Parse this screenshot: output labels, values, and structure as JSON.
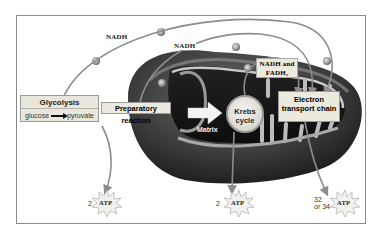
{
  "diagram": {
    "stages": {
      "glycolysis": {
        "title": "Glycolysis",
        "reactant": "glucose",
        "product": "pyruvate"
      },
      "preparatory_reaction": "Preparatory reaction",
      "krebs_cycle": "Krebs cycle",
      "electron_transport_chain": "Electron transport chain"
    },
    "region_labels": {
      "matrix": "Matrix"
    },
    "carriers": {
      "nadh_outer": "NADH",
      "nadh_inner": "NADH",
      "nadh_fadh2_line1": "NADH and",
      "nadh_fadh2_line2": "FADH₂"
    },
    "atp_outputs": [
      {
        "stage": "glycolysis",
        "count": "2",
        "label": "ATP"
      },
      {
        "stage": "krebs_cycle",
        "count": "2",
        "label": "ATP"
      },
      {
        "stage": "electron_transport_chain",
        "count_line1": "32",
        "count_line2": "or 34",
        "label": "ATP"
      }
    ],
    "colors": {
      "frame": "#8a8a8a",
      "arrow": "#8c8c8c",
      "mito_outer": "#3a3a3a",
      "label_box": "#e9e6dc"
    }
  }
}
